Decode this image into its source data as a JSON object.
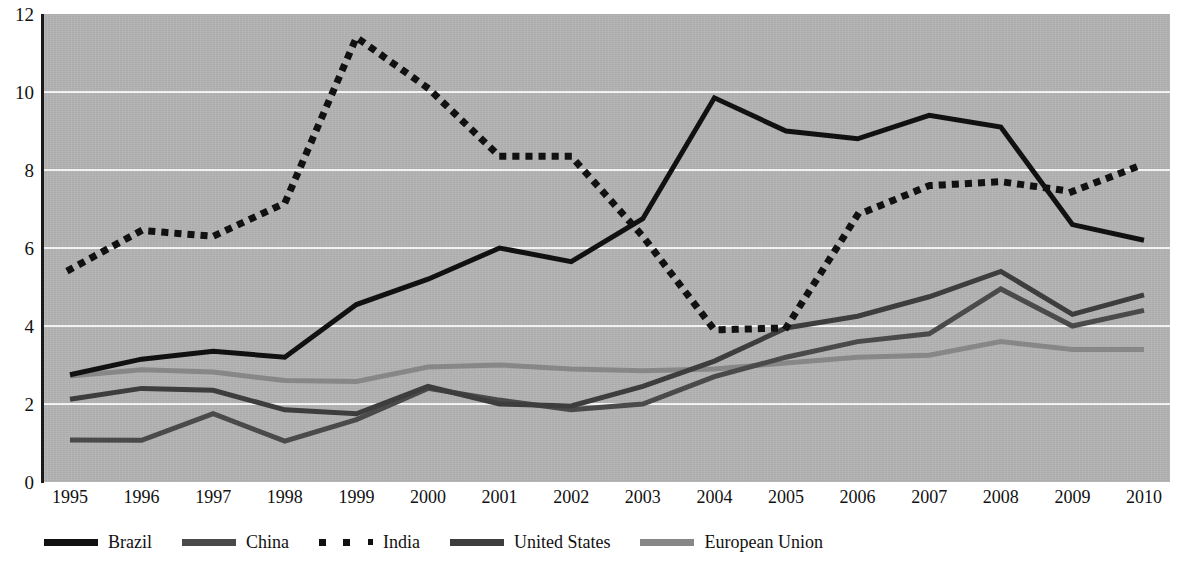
{
  "chart_data": {
    "type": "line",
    "title": "",
    "xlabel": "",
    "ylabel": "",
    "categories": [
      1995,
      1996,
      1997,
      1998,
      1999,
      2000,
      2001,
      2002,
      2003,
      2004,
      2005,
      2006,
      2007,
      2008,
      2009,
      2010
    ],
    "x_tick_labels": [
      "1995",
      "1996",
      "1997",
      "1998",
      "1999",
      "2000",
      "2001",
      "2002",
      "2003",
      "2004",
      "2005",
      "2006",
      "2007",
      "2008",
      "2009",
      "2010"
    ],
    "y_tick_labels": [
      "0",
      "2",
      "4",
      "6",
      "8",
      "10",
      "12"
    ],
    "y_ticks": [
      0,
      2,
      4,
      6,
      8,
      10,
      12
    ],
    "ylim": [
      0,
      12
    ],
    "grid": true,
    "legend_position": "bottom-left",
    "plot_background": "#b3b3b3",
    "gridline_color": "#f2f2f2",
    "series": [
      {
        "name": "Brazil",
        "color": "#111111",
        "style": "solid",
        "width": 5,
        "values": [
          2.75,
          3.15,
          3.35,
          3.2,
          4.55,
          5.2,
          6.0,
          5.65,
          6.75,
          9.85,
          9.0,
          8.8,
          9.4,
          9.1,
          6.6,
          6.2
        ]
      },
      {
        "name": "China",
        "color": "#4a4a4a",
        "style": "solid",
        "width": 5,
        "values": [
          1.08,
          1.07,
          1.75,
          1.05,
          1.6,
          2.4,
          2.1,
          1.85,
          2.0,
          2.7,
          3.2,
          3.6,
          3.8,
          4.95,
          4.0,
          4.4
        ]
      },
      {
        "name": "India",
        "color": "#111111",
        "style": "dotted",
        "width": 7,
        "values": [
          5.45,
          6.45,
          6.3,
          7.15,
          11.4,
          10.1,
          8.35,
          8.35,
          6.3,
          3.9,
          3.95,
          6.85,
          7.6,
          7.7,
          7.45,
          8.15
        ]
      },
      {
        "name": "United States",
        "color": "#3d3d3d",
        "style": "solid",
        "width": 5,
        "values": [
          2.12,
          2.4,
          2.35,
          1.85,
          1.75,
          2.45,
          2.0,
          1.95,
          2.45,
          3.1,
          3.95,
          4.25,
          4.75,
          5.4,
          4.3,
          4.8
        ]
      },
      {
        "name": "European Union",
        "color": "#878787",
        "style": "solid",
        "width": 5,
        "values": [
          2.72,
          2.88,
          2.82,
          2.6,
          2.58,
          2.95,
          3.0,
          2.9,
          2.85,
          2.9,
          3.05,
          3.2,
          3.25,
          3.6,
          3.4,
          3.4
        ]
      }
    ],
    "legend": [
      {
        "label": "Brazil",
        "color": "#111111",
        "style": "solid"
      },
      {
        "label": "China",
        "color": "#4a4a4a",
        "style": "solid"
      },
      {
        "label": "India",
        "color": "#111111",
        "style": "dotted"
      },
      {
        "label": "United States",
        "color": "#3d3d3d",
        "style": "solid"
      },
      {
        "label": "European Union",
        "color": "#878787",
        "style": "solid"
      }
    ]
  }
}
